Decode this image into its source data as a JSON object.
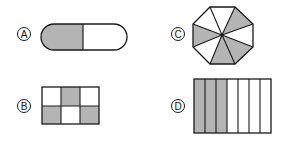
{
  "options": [
    {
      "id": "A",
      "label": "A",
      "shape": "capsule",
      "parts": 2,
      "shaded": 1
    },
    {
      "id": "B",
      "label": "B",
      "shape": "rectangle-grid",
      "parts": 6,
      "shaded": 3
    },
    {
      "id": "C",
      "label": "C",
      "shape": "octagon",
      "parts": 8,
      "shaded": 4
    },
    {
      "id": "D",
      "label": "D",
      "shape": "rectangle-strips",
      "parts": 7,
      "shaded": 3
    }
  ],
  "colors": {
    "shade": "#b4b4b4",
    "stroke": "#1a1a1a",
    "background": "#ffffff"
  }
}
